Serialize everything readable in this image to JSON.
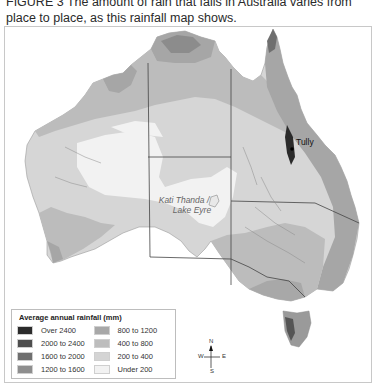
{
  "caption": {
    "figure_label": "FIGURE 3",
    "text": "The amount of rain that falls in Australia varies from place to place, as this rainfall map shows."
  },
  "map": {
    "title": "Australia average annual rainfall",
    "place_labels": {
      "lake": "Kati Thanda / Lake Eyre",
      "lake_line1": "Kati Thanda /",
      "lake_line2": "Lake Eyre",
      "town": "Tully"
    }
  },
  "legend": {
    "title": "Average annual rainfall (mm)",
    "items": [
      {
        "label": "Over 2400",
        "color": "#2b2b2b"
      },
      {
        "label": "800 to 1200",
        "color": "#a8a8a8"
      },
      {
        "label": "2000 to 2400",
        "color": "#4e4e4e"
      },
      {
        "label": "400 to 800",
        "color": "#bdbdbd"
      },
      {
        "label": "1600 to 2000",
        "color": "#6f6f6f"
      },
      {
        "label": "200 to 400",
        "color": "#d4d4d4"
      },
      {
        "label": "1200 to 1600",
        "color": "#8e8e8e"
      },
      {
        "label": "Under 200",
        "color": "#f2f2f2"
      }
    ]
  },
  "compass": {
    "n": "N",
    "s": "S",
    "e": "E",
    "w": "W"
  },
  "scale_bar": {
    "ticks": [
      "0",
      "250",
      "500 km"
    ]
  }
}
